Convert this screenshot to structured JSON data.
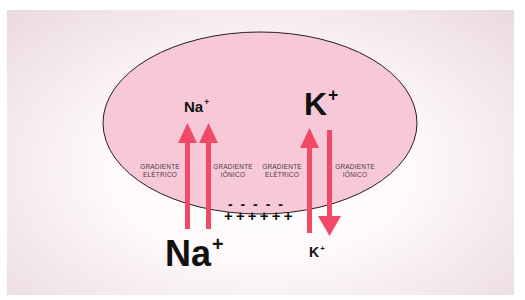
{
  "diagram": {
    "colors": {
      "cell_fill": "#f7c9d8",
      "cell_stroke": "#2a1a1e",
      "arrow": "#f04a68",
      "text": "#111111",
      "label_text": "#4a3a3f"
    },
    "inside": {
      "na_label": "Na",
      "na_charge": "+",
      "k_label": "K",
      "k_charge": "+"
    },
    "outside": {
      "na_label": "Na",
      "na_charge": "+",
      "k_label": "K",
      "k_charge": "+"
    },
    "gradients": [
      {
        "line1": "GRADIENTE",
        "line2": "ELÉTRICO",
        "ion": "Na+",
        "direction": "in"
      },
      {
        "line1": "GRADIENTE",
        "line2": "IÔNICO",
        "ion": "Na+",
        "direction": "in"
      },
      {
        "line1": "GRADIENTE",
        "line2": "ELÉTRICO",
        "ion": "K+",
        "direction": "in"
      },
      {
        "line1": "GRADIENTE",
        "line2": "IÔNICO",
        "ion": "K+",
        "direction": "out"
      }
    ],
    "membrane_charges": {
      "inside": "- - - - -",
      "outside": "+ + + + + +"
    }
  }
}
